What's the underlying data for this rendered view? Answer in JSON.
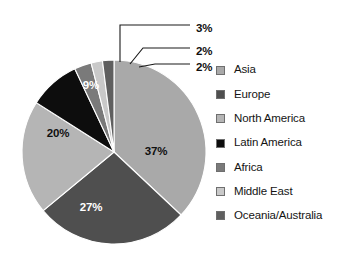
{
  "chart_data": {
    "type": "pie",
    "title": "",
    "subtitle": "",
    "xlabel": "",
    "ylabel": "",
    "grid": false,
    "legend_position": "right",
    "total_label": "100%",
    "start_angle_deg": 0,
    "direction": "clockwise",
    "categories": [
      "Asia",
      "Europe",
      "North America",
      "Latin America",
      "Africa",
      "Middle East",
      "Oceania/Australia"
    ],
    "values": [
      37,
      27,
      20,
      9,
      3,
      2,
      2
    ],
    "value_labels": [
      "37%",
      "27%",
      "20%",
      "9%",
      "3%",
      "2%",
      "2%"
    ],
    "slices": [
      {
        "label": "Asia",
        "value": 37,
        "display": "37%",
        "color": "#a9a9a9",
        "label_placement": "inside",
        "label_color": "on-light"
      },
      {
        "label": "Europe",
        "value": 27,
        "display": "27%",
        "color": "#4f4f4f",
        "label_placement": "inside",
        "label_color": "on-dark"
      },
      {
        "label": "North America",
        "value": 20,
        "display": "20%",
        "color": "#b5b5b5",
        "label_placement": "inside",
        "label_color": "on-light"
      },
      {
        "label": "Latin America",
        "value": 9,
        "display": "9%",
        "color": "#0d0d0d",
        "label_placement": "inside",
        "label_color": "on-dark"
      },
      {
        "label": "Africa",
        "value": 3,
        "display": "3%",
        "color": "#7a7a7a",
        "label_placement": "callout",
        "label_color": "on-light"
      },
      {
        "label": "Middle East",
        "value": 2,
        "display": "2%",
        "color": "#c9c9c9",
        "label_placement": "callout",
        "label_color": "on-light"
      },
      {
        "label": "Oceania/Australia",
        "value": 2,
        "display": "2%",
        "color": "#5f5f5f",
        "label_placement": "callout",
        "label_color": "on-light"
      }
    ]
  },
  "pie": {
    "center_x": 114,
    "center_y": 152,
    "radius": 92,
    "inner_labels": [
      {
        "name": "asia",
        "text": "37%",
        "x": 156,
        "y": 155,
        "tone": "on-light"
      },
      {
        "name": "europe",
        "text": "27%",
        "x": 91,
        "y": 211,
        "tone": "on-dark"
      },
      {
        "name": "north-america",
        "text": "20%",
        "x": 58,
        "y": 137,
        "tone": "on-light"
      },
      {
        "name": "latin-america",
        "text": "9%",
        "x": 91,
        "y": 89,
        "tone": "on-dark"
      }
    ],
    "callouts": [
      {
        "name": "africa",
        "text": "3%",
        "text_x": 196,
        "text_y": 29,
        "path": "M 120 62 L 120 25 L 190 25"
      },
      {
        "name": "middle-east",
        "text": "2%",
        "text_x": 196,
        "text_y": 52,
        "path": "M 130 64 L 143 48 L 190 48"
      },
      {
        "name": "oceania",
        "text": "2%",
        "text_x": 196,
        "text_y": 68,
        "path": "M 139 67 L 155 64 L 190 64"
      }
    ]
  },
  "legend": {
    "items": [
      {
        "label": "Asia",
        "color": "#a9a9a9",
        "name": "asia"
      },
      {
        "label": "Europe",
        "color": "#4f4f4f",
        "name": "europe"
      },
      {
        "label": "North America",
        "color": "#b5b5b5",
        "name": "north-america"
      },
      {
        "label": "Latin America",
        "color": "#0d0d0d",
        "name": "latin-america"
      },
      {
        "label": "Africa",
        "color": "#7a7a7a",
        "name": "africa"
      },
      {
        "label": "Middle East",
        "color": "#c9c9c9",
        "name": "middle-east"
      },
      {
        "label": "Oceania/Australia",
        "color": "#5f5f5f",
        "name": "oceania-australia"
      }
    ]
  }
}
